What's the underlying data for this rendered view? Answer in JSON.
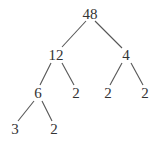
{
  "diagram": {
    "type": "factor-tree",
    "root": "48",
    "nodes": [
      {
        "id": "n48",
        "label": "48",
        "x": 90,
        "y": 19
      },
      {
        "id": "n12",
        "label": "12",
        "x": 56,
        "y": 60
      },
      {
        "id": "n4",
        "label": "4",
        "x": 126,
        "y": 60
      },
      {
        "id": "n6",
        "label": "6",
        "x": 38,
        "y": 98
      },
      {
        "id": "n2a",
        "label": "2",
        "x": 76,
        "y": 98
      },
      {
        "id": "n2b",
        "label": "2",
        "x": 108,
        "y": 98
      },
      {
        "id": "n2c",
        "label": "2",
        "x": 145,
        "y": 98
      },
      {
        "id": "n3",
        "label": "3",
        "x": 15,
        "y": 134
      },
      {
        "id": "n2d",
        "label": "2",
        "x": 54,
        "y": 134
      }
    ],
    "edges": [
      {
        "from": "n48",
        "to": "n12",
        "x1": 86,
        "y1": 21,
        "x2": 62,
        "y2": 47
      },
      {
        "from": "n48",
        "to": "n4",
        "x1": 95,
        "y1": 21,
        "x2": 122,
        "y2": 48
      },
      {
        "from": "n12",
        "to": "n6",
        "x1": 51,
        "y1": 63,
        "x2": 40,
        "y2": 85
      },
      {
        "from": "n12",
        "to": "n2a",
        "x1": 62,
        "y1": 63,
        "x2": 74,
        "y2": 85
      },
      {
        "from": "n4",
        "to": "n2b",
        "x1": 122,
        "y1": 63,
        "x2": 110,
        "y2": 85
      },
      {
        "from": "n4",
        "to": "n2c",
        "x1": 131,
        "y1": 63,
        "x2": 143,
        "y2": 85
      },
      {
        "from": "n6",
        "to": "n3",
        "x1": 34,
        "y1": 101,
        "x2": 18,
        "y2": 121
      },
      {
        "from": "n6",
        "to": "n2d",
        "x1": 42,
        "y1": 101,
        "x2": 52,
        "y2": 121
      }
    ],
    "prime_factorization": "48 = 3 × 2 × 2 × 2 × 2"
  }
}
